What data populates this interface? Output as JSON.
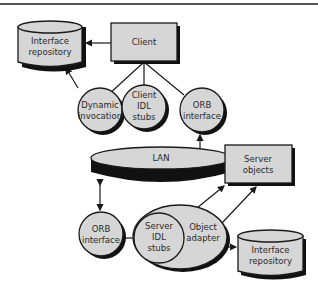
{
  "diagram": {
    "nodes": {
      "interface_repository_top": {
        "line1": "Interface",
        "line2": "repository"
      },
      "client": {
        "label": "Client"
      },
      "dynamic_invocation": {
        "line1": "Dynamic",
        "line2": "invocation"
      },
      "client_idl_stubs": {
        "line1": "Client",
        "line2": "IDL",
        "line3": "stubs"
      },
      "orb_interface_top": {
        "line1": "ORB",
        "line2": "interface"
      },
      "lan": {
        "label": "LAN"
      },
      "server_objects": {
        "line1": "Server",
        "line2": "objects"
      },
      "orb_interface_bottom": {
        "line1": "ORB",
        "line2": "interface"
      },
      "server_idl_stubs": {
        "line1": "Server",
        "line2": "IDL",
        "line3": "stubs"
      },
      "object_adapter": {
        "line1": "Object",
        "line2": "adapter"
      },
      "interface_repository_bottom": {
        "line1": "Interface",
        "line2": "repository"
      }
    },
    "colors": {
      "fill": "#d6d6d6",
      "stroke": "#1a1a1a",
      "shadow": "#111111",
      "rule": "#555555"
    }
  }
}
